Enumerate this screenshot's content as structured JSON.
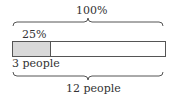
{
  "diagram": {
    "type": "tape-diagram",
    "top_label": "100%",
    "part_label": "25%",
    "part_quantity": "3 people",
    "total_quantity": "12 people",
    "part_fraction": 0.25,
    "colors": {
      "part_fill": "#d9d9d9",
      "stroke": "#555555"
    }
  }
}
